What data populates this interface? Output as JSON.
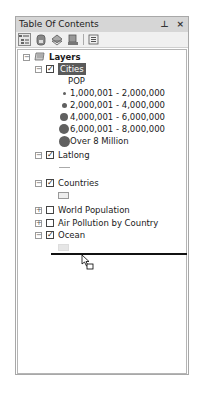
{
  "window": {
    "title": "Table Of Contents",
    "pin_icon": "pin-icon",
    "close_icon": "close-icon",
    "pin_glyph": "⊥",
    "close_glyph": "×"
  },
  "toolbar": {
    "buttons": [
      {
        "name": "list-by-drawing-order",
        "icon": "drawing-order-icon",
        "active": true
      },
      {
        "name": "list-by-source",
        "icon": "source-icon"
      },
      {
        "name": "list-by-visibility",
        "icon": "visibility-icon"
      },
      {
        "name": "list-by-selection",
        "icon": "selection-icon"
      },
      {
        "name": "options",
        "icon": "options-icon"
      }
    ]
  },
  "tree": {
    "root": {
      "label": "Layers",
      "expanded": true
    },
    "layers": [
      {
        "label": "Cities",
        "checked": true,
        "expanded": true,
        "selected": true,
        "legend_field": "POP",
        "classes": [
          {
            "label": "1,000,001 - 2,000,000",
            "size": 3
          },
          {
            "label": "2,000,001 - 4,000,000",
            "size": 5
          },
          {
            "label": "4,000,001 - 6,000,000",
            "size": 8
          },
          {
            "label": "6,000,001 - 8,000,000",
            "size": 9
          },
          {
            "label": "Over 8 Million",
            "size": 11
          }
        ]
      },
      {
        "label": "Latlong",
        "checked": true,
        "expanded": true,
        "symbol": "line"
      },
      {
        "label": "Countries",
        "checked": true,
        "expanded": true,
        "symbol": "polygon"
      },
      {
        "label": "World Population",
        "checked": false,
        "expanded": false
      },
      {
        "label": "Air Pollution by Country",
        "checked": false,
        "expanded": false
      },
      {
        "label": "Ocean",
        "checked": true,
        "expanded": true,
        "symbol": "polygon"
      }
    ],
    "glyphs": {
      "minus": "−",
      "plus": "+",
      "check": "✓"
    }
  },
  "drag": {
    "cursor_icon": "drag-cursor-icon",
    "drop_indicator": "drop-line"
  }
}
